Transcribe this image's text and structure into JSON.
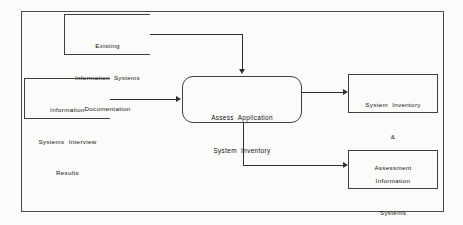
{
  "diagram": {
    "type": "data-flow-diagram",
    "background_color": "#fbfbf9",
    "line_color": "#2e2e2e",
    "border_color": "#3f3f3f",
    "text_color": "#111111",
    "sources": [
      {
        "id": "existing-documentation",
        "shape": "open-ended-box",
        "lines": [
          "Existing",
          "Information  Systems",
          "Documentation"
        ]
      },
      {
        "id": "interview-results",
        "shape": "open-ended-box",
        "lines": [
          "Information",
          "Systems  Interview",
          "Results"
        ]
      }
    ],
    "process": {
      "id": "assess-application-system-inventory",
      "shape": "rounded-rectangle",
      "lines": [
        "Assess  Application",
        "System  Inventory"
      ]
    },
    "destinations": [
      {
        "id": "system-inventory-assessment",
        "shape": "rectangle",
        "lines": [
          "System  Inventory",
          "&",
          "Assessment"
        ]
      },
      {
        "id": "information-systems-needs-notes",
        "shape": "rectangle",
        "lines": [
          "Information",
          "Systems",
          "Needs    \"Notes\""
        ]
      }
    ],
    "flows": [
      {
        "id": "flow-documentation-to-process",
        "from": "existing-documentation",
        "to": "assess-application-system-inventory",
        "routing": "right-then-down",
        "arrow": "down"
      },
      {
        "id": "flow-interview-to-process",
        "from": "interview-results",
        "to": "assess-application-system-inventory",
        "routing": "straight-right",
        "arrow": "right"
      },
      {
        "id": "flow-process-to-inventory",
        "from": "assess-application-system-inventory",
        "to": "system-inventory-assessment",
        "routing": "straight-right",
        "arrow": "right"
      },
      {
        "id": "flow-process-to-needs",
        "from": "assess-application-system-inventory",
        "to": "information-systems-needs-notes",
        "routing": "down-then-right",
        "arrow": "right"
      }
    ]
  }
}
